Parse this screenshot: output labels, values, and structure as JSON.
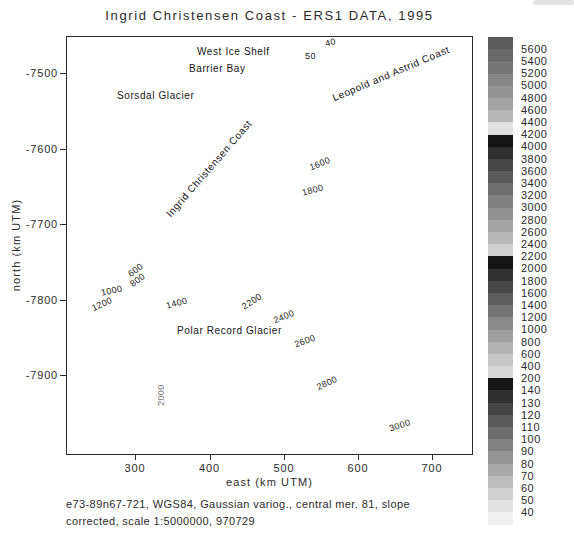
{
  "title": "Ingrid Christensen Coast - ERS1 DATA, 1995",
  "caption": {
    "line1": "e73-89n67-721, WGS84, Gaussian variog., central mer. 81, slope",
    "line2": "corrected, scale 1:5000000, 970729"
  },
  "axes": {
    "x": {
      "label": "east (km UTM)",
      "ticks": [
        "300",
        "400",
        "500",
        "600",
        "700"
      ]
    },
    "y": {
      "label": "north (km UTM)",
      "ticks": [
        "-7500",
        "-7600",
        "-7700",
        "-7800",
        "-7900"
      ]
    }
  },
  "annotations": {
    "west_ice_shelf": {
      "text": "West Ice Shelf",
      "x": 197,
      "y": 46,
      "rot": 0
    },
    "barrier_bay": {
      "text": "Barrier Bay",
      "x": 189,
      "y": 63,
      "rot": 0
    },
    "sorsdal_glacier": {
      "text": "Sorsdal Glacier",
      "x": 117,
      "y": 90,
      "rot": 0
    },
    "polar_record_glacier": {
      "text": "Polar Record Glacier",
      "x": 177,
      "y": 325,
      "rot": 0
    },
    "leopold_astrid_coast": {
      "text": "Leopold and Astrid Coast",
      "cx": 391,
      "cy": 75,
      "rot": -23
    },
    "ingrid_christensen_coast": {
      "text": "Ingrid Christensen Coast",
      "cx": 209,
      "cy": 170,
      "rot": -49
    }
  },
  "contour_labels": [
    {
      "text": "50",
      "x": 305,
      "y": 51,
      "rot": 0
    },
    {
      "text": "40",
      "x": 324,
      "y": 39,
      "rot": -15
    },
    {
      "text": "1600",
      "x": 308,
      "y": 163,
      "rot": -22
    },
    {
      "text": "1800",
      "x": 301,
      "y": 188,
      "rot": -15
    },
    {
      "text": "600",
      "x": 126,
      "y": 271,
      "rot": -38
    },
    {
      "text": "800",
      "x": 128,
      "y": 281,
      "rot": -38
    },
    {
      "text": "1000",
      "x": 100,
      "y": 288,
      "rot": -12
    },
    {
      "text": "1200",
      "x": 90,
      "y": 304,
      "rot": -25
    },
    {
      "text": "1400",
      "x": 165,
      "y": 301,
      "rot": -15
    },
    {
      "text": "2000",
      "x": 156,
      "y": 406,
      "rot": -90,
      "color": "#777777"
    },
    {
      "text": "2200",
      "x": 240,
      "y": 303,
      "rot": -33
    },
    {
      "text": "2400",
      "x": 272,
      "y": 316,
      "rot": -22
    },
    {
      "text": "2600",
      "x": 293,
      "y": 340,
      "rot": -20
    },
    {
      "text": "2800",
      "x": 315,
      "y": 383,
      "rot": -25
    },
    {
      "text": "3000",
      "x": 388,
      "y": 424,
      "rot": -18
    }
  ],
  "map": {
    "ocean_color": "#ffffff",
    "shelf_color": "#e4e4e4",
    "coast_color": "#0a0a0a",
    "contour_line_color": "#555555",
    "band_colors": [
      "#f1f1f1",
      "#e6e6e6",
      "#dbdbdb",
      "#cfcfcf",
      "#c2c2c2",
      "#b4b4b4",
      "#a4a4a4",
      "#919191",
      "#7c7c7c",
      "#5e5e5e",
      "#1c1c1c",
      "#ececec",
      "#e0e0e0",
      "#d4d4d4",
      "#c7c7c7",
      "#bcbcbc"
    ]
  },
  "colorbar": {
    "labels": [
      "5600",
      "5400",
      "5200",
      "5000",
      "4800",
      "4600",
      "4400",
      "4200",
      "4000",
      "3800",
      "3600",
      "3400",
      "3200",
      "3000",
      "2800",
      "2600",
      "2400",
      "2200",
      "2000",
      "1800",
      "1600",
      "1400",
      "1200",
      "1000",
      "800",
      "600",
      "400",
      "200",
      "140",
      "130",
      "120",
      "110",
      "100",
      "90",
      "80",
      "70",
      "60",
      "50",
      "40"
    ],
    "cell_colors": [
      "#5a5a5a",
      "#686868",
      "#767676",
      "#858585",
      "#949494",
      "#a4a4a4",
      "#b8b8b8",
      "#e0e0e0",
      "#141414",
      "#303030",
      "#464646",
      "#5a5a5a",
      "#6e6e6e",
      "#808080",
      "#929292",
      "#a4a4a4",
      "#b8b8b8",
      "#d0d0d0",
      "#141414",
      "#323232",
      "#484848",
      "#5e5e5e",
      "#747474",
      "#8a8a8a",
      "#9e9e9e",
      "#b2b2b2",
      "#c6c6c6",
      "#d8d8d8",
      "#161616",
      "#303030",
      "#454545",
      "#595959",
      "#6d6d6d",
      "#818181",
      "#959595",
      "#a9a9a9",
      "#bdbdbd",
      "#d1d1d1",
      "#e2e2e2",
      "#f0f0f0"
    ]
  },
  "chart_data": {
    "type": "heatmap",
    "subtype": "filled-contour-map",
    "title": "Ingrid Christensen Coast - ERS1 DATA, 1995",
    "xlabel": "east (km UTM)",
    "ylabel": "north (km UTM)",
    "xlim": [
      207,
      753
    ],
    "ylim": [
      -8006,
      -7451
    ],
    "x_ticks": [
      300,
      400,
      500,
      600,
      700
    ],
    "y_ticks": [
      -7500,
      -7600,
      -7700,
      -7800,
      -7900
    ],
    "grid": false,
    "legend_position": "right-colorbar",
    "contour_interval_major": 200,
    "contour_interval_minor": 10,
    "colorbar_levels": [
      5600,
      5400,
      5200,
      5000,
      4800,
      4600,
      4400,
      4200,
      4000,
      3800,
      3600,
      3400,
      3200,
      3000,
      2800,
      2600,
      2400,
      2200,
      2000,
      1800,
      1600,
      1400,
      1200,
      1000,
      800,
      600,
      400,
      200,
      140,
      130,
      120,
      110,
      100,
      90,
      80,
      70,
      60,
      50,
      40
    ],
    "map_labeled_contours": [
      40,
      50,
      600,
      800,
      1000,
      1200,
      1400,
      1600,
      1800,
      2000,
      2200,
      2400,
      2600,
      2800,
      3000
    ],
    "named_features": [
      "West Ice Shelf",
      "Barrier Bay",
      "Sorsdal Glacier",
      "Leopold and Astrid Coast",
      "Ingrid Christensen Coast",
      "Polar Record Glacier"
    ],
    "caption": "e73-89n67-721, WGS84, Gaussian variog., central mer. 81, slope corrected, scale 1:5000000, 970729"
  }
}
